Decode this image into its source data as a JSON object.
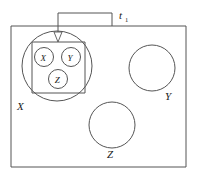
{
  "figure": {
    "type": "set-membership-diagram",
    "background_color": "#ffffff",
    "line_color": "#555555",
    "text_color": "#1a1a1a"
  },
  "annotation": {
    "bracket_label": "t",
    "bracket_label_subscript": "1",
    "bracket_label_full": "t₁"
  },
  "outer_box": {
    "name": "universe-rectangle"
  },
  "shapes": [
    {
      "id": "big-circle-x",
      "label": "X",
      "role": "outer-set-x"
    },
    {
      "id": "circle-y",
      "label": "Y",
      "role": "outer-set-y"
    },
    {
      "id": "circle-z",
      "label": "Z",
      "role": "outer-set-z"
    }
  ],
  "inner_box": {
    "name": "inner-rectangle",
    "members": [
      {
        "id": "inner-circle-x",
        "label": "X"
      },
      {
        "id": "inner-circle-y",
        "label": "Y"
      },
      {
        "id": "inner-circle-z",
        "label": "Z"
      }
    ]
  }
}
